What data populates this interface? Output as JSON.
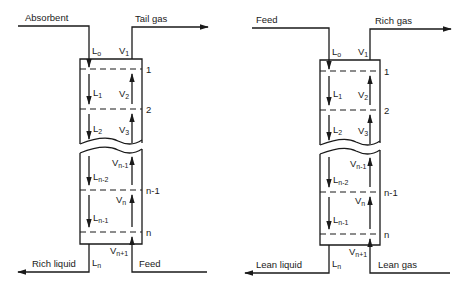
{
  "diagrams": [
    {
      "id": "absorber",
      "top_left_label": "Absorbent",
      "top_right_label": "Tail gas",
      "bottom_left_label": "Rich liquid",
      "bottom_right_label": "Feed",
      "trays": [
        "1",
        "2",
        "n-1",
        "n"
      ],
      "liquid_labels": [
        {
          "base": "L",
          "sub": "o"
        },
        {
          "base": "L",
          "sub": "1"
        },
        {
          "base": "L",
          "sub": "2"
        },
        {
          "base": "L",
          "sub": "n-2"
        },
        {
          "base": "L",
          "sub": "n-1"
        },
        {
          "base": "L",
          "sub": "n"
        }
      ],
      "vapor_labels": [
        {
          "base": "V",
          "sub": "1"
        },
        {
          "base": "V",
          "sub": "2"
        },
        {
          "base": "V",
          "sub": "3"
        },
        {
          "base": "V",
          "sub": "n-1"
        },
        {
          "base": "V",
          "sub": "n"
        },
        {
          "base": "V",
          "sub": "n+1"
        }
      ]
    },
    {
      "id": "stripper",
      "top_left_label": "Feed",
      "top_right_label": "Rich gas",
      "bottom_left_label": "Lean liquid",
      "bottom_right_label": "Lean gas",
      "trays": [
        "1",
        "2",
        "n-1",
        "n"
      ],
      "liquid_labels": [
        {
          "base": "L",
          "sub": "o"
        },
        {
          "base": "L",
          "sub": "1"
        },
        {
          "base": "L",
          "sub": "2"
        },
        {
          "base": "L",
          "sub": "n-2"
        },
        {
          "base": "L",
          "sub": "n-1"
        },
        {
          "base": "L",
          "sub": "n"
        }
      ],
      "vapor_labels": [
        {
          "base": "V",
          "sub": "1"
        },
        {
          "base": "V",
          "sub": "2"
        },
        {
          "base": "V",
          "sub": "3"
        },
        {
          "base": "V",
          "sub": "n-1"
        },
        {
          "base": "V",
          "sub": "n"
        },
        {
          "base": "V",
          "sub": "n+1"
        }
      ]
    }
  ],
  "colors": {
    "line": "#1a1a1a",
    "background": "#ffffff"
  }
}
